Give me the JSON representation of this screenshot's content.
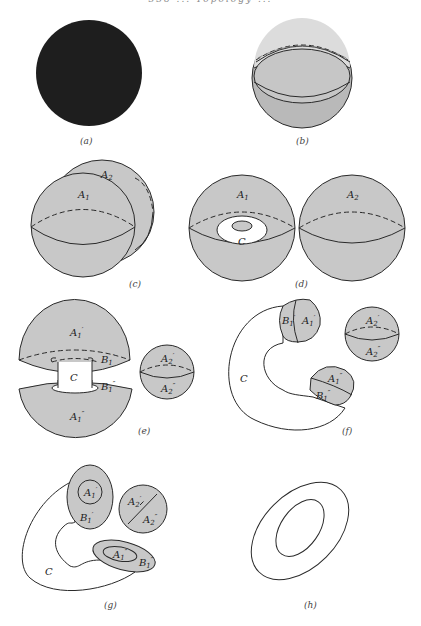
{
  "header": {
    "running_head": "338 ... Topology ..."
  },
  "panels": [
    {
      "id": "a",
      "caption": "(a)",
      "labels": []
    },
    {
      "id": "b",
      "caption": "(b)",
      "labels": []
    },
    {
      "id": "c",
      "caption": "(c)",
      "labels": [
        "A1",
        "A2"
      ]
    },
    {
      "id": "d",
      "caption": "(d)",
      "labels": [
        "A1",
        "C",
        "A2"
      ]
    },
    {
      "id": "e",
      "caption": "(e)",
      "labels": [
        "A1'",
        "B1'",
        "C",
        "B1''",
        "A1''",
        "A2'",
        "A2''"
      ]
    },
    {
      "id": "f",
      "caption": "(f)",
      "labels": [
        "B1'",
        "A1'",
        "A2'",
        "A2''",
        "C",
        "A1''",
        "B1''"
      ]
    },
    {
      "id": "g",
      "caption": "(g)",
      "labels": [
        "A1'",
        "B1'",
        "A2'",
        "A2''",
        "A1''",
        "B1''",
        "C"
      ]
    },
    {
      "id": "h",
      "caption": "(h)",
      "labels": []
    }
  ],
  "colors": {
    "fill_gray": "#c8c8c8",
    "fill_dark": "#1e1e1e",
    "stroke": "#2a2a2a"
  }
}
